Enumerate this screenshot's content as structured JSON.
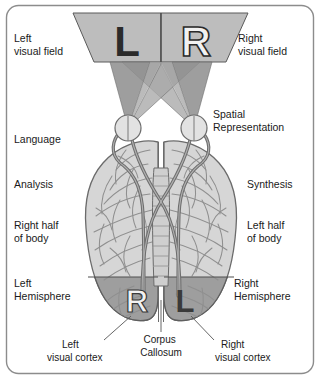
{
  "figure": {
    "frame": {
      "border_color": "#8c8c8c",
      "background": "#ffffff",
      "corner_radius": 12
    }
  },
  "colors": {
    "frame_border": "#8c8c8c",
    "visual_field_fill": "#bdbdbd",
    "visual_field_stroke": "#5a5a5a",
    "cone_left_fill": "#9a9a9a",
    "cone_right_fill": "#b5b5b5",
    "cortex_fill": "#d6d6d6",
    "cortex_stroke": "#6b6b6b",
    "sulci_stroke": "#8f8f8f",
    "occipital_fill": "#9e9e9e",
    "nerve_stroke": "#6e6e6e",
    "eye_fill": "#e2e2e2",
    "letter_dark": "#2b2b2b",
    "letter_light": "#f2f2f2",
    "text": "#1a1a1a",
    "leader_line": "#555555"
  },
  "visual_field": {
    "letters": [
      {
        "name": "letter-L-field",
        "text": "L",
        "style": "dark",
        "x": 127,
        "y": 48
      },
      {
        "name": "letter-R-field",
        "text": "R",
        "style": "light",
        "x": 196,
        "y": 48
      }
    ],
    "divider_label": "midline"
  },
  "occipital_letters": [
    {
      "name": "letter-R-cortex",
      "text": "R",
      "style": "light",
      "x": 137,
      "y": 305
    },
    {
      "name": "letter-L-cortex",
      "text": "L",
      "style": "dark",
      "x": 184,
      "y": 305
    }
  ],
  "labels": {
    "left_column": [
      {
        "name": "label-left-visual-field",
        "lines": [
          "Left",
          "visual field"
        ],
        "x": 14,
        "y": 42
      },
      {
        "name": "label-language",
        "lines": [
          "Language"
        ],
        "x": 14,
        "y": 143
      },
      {
        "name": "label-analysis",
        "lines": [
          "Analysis"
        ],
        "x": 14,
        "y": 188
      },
      {
        "name": "label-right-half-of-body",
        "lines": [
          "Right half",
          "of body"
        ],
        "x": 14,
        "y": 229
      },
      {
        "name": "label-left-hemisphere",
        "lines": [
          "Left",
          "Hemisphere"
        ],
        "x": 14,
        "y": 287
      }
    ],
    "right_column": [
      {
        "name": "label-right-visual-field",
        "lines": [
          "Right",
          "visual field"
        ],
        "x": 238,
        "y": 42
      },
      {
        "name": "label-spatial-representation",
        "lines": [
          "Spatial",
          "Representation"
        ],
        "x": 213,
        "y": 118
      },
      {
        "name": "label-synthesis",
        "lines": [
          "Synthesis"
        ],
        "x": 247,
        "y": 188
      },
      {
        "name": "label-left-half-of-body",
        "lines": [
          "Left half",
          "of body"
        ],
        "x": 247,
        "y": 229
      },
      {
        "name": "label-right-hemisphere",
        "lines": [
          "Right",
          "Hemisphere"
        ],
        "x": 234,
        "y": 287
      }
    ],
    "callouts": [
      {
        "name": "label-left-visual-cortex",
        "lines": [
          "Left",
          "visual cortex"
        ],
        "x": 62,
        "y": 344,
        "anchor": "start"
      },
      {
        "name": "label-corpus-callosum",
        "lines": [
          "Corpus",
          "Callosum"
        ],
        "x": 161,
        "y": 344,
        "anchor": "middle"
      },
      {
        "name": "label-right-visual-cortex",
        "lines": [
          "Right",
          "visual cortex"
        ],
        "x": 215,
        "y": 344,
        "anchor": "start"
      }
    ],
    "leader_lines": [
      {
        "name": "leader-left-visual-cortex",
        "x1": 131,
        "y1": 316,
        "x2": 104,
        "y2": 340
      },
      {
        "name": "leader-corpus-callosum",
        "x1": 161,
        "y1": 300,
        "x2": 161,
        "y2": 332
      },
      {
        "name": "leader-right-visual-cortex",
        "x1": 191,
        "y1": 316,
        "x2": 214,
        "y2": 340
      }
    ]
  },
  "anatomy": {
    "eyes": [
      {
        "name": "eye-left",
        "cx": 128,
        "cy": 128,
        "r": 13
      },
      {
        "name": "eye-right",
        "cx": 194,
        "cy": 128,
        "r": 13
      }
    ],
    "optic_chiasm": {
      "name": "optic-chiasm",
      "cx": 161,
      "cy": 205
    },
    "brain": {
      "name": "brain-cortex",
      "top": 140,
      "bottom": 322,
      "left": 84,
      "right": 238
    },
    "occipital_divider_y": 277
  }
}
